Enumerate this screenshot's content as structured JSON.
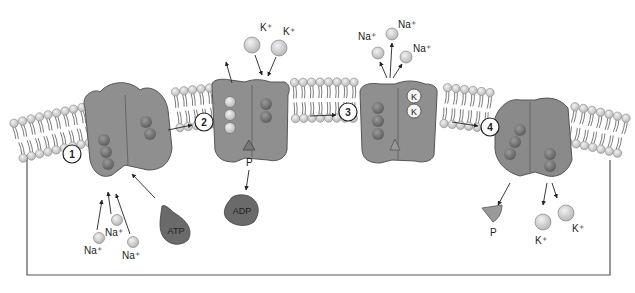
{
  "diagram": {
    "colors": {
      "protein": "#8f8f8f",
      "protein_dark": "#6f6f6f",
      "atp": "#6a6a6a",
      "ion": "#d6d6d6",
      "lipid_head": "#cfcfcf",
      "cell_outline": "#555555"
    },
    "steps": [
      {
        "number": "1"
      },
      {
        "number": "2"
      },
      {
        "number": "3"
      },
      {
        "number": "4"
      }
    ],
    "labels": {
      "k_top_1": "K⁺",
      "k_top_2": "K⁺",
      "na_top_1": "Na⁺",
      "na_top_2": "Na⁺",
      "na_top_3": "Na⁺",
      "k_bound_1": "K",
      "k_bound_2": "K",
      "phosphate_bound": "P",
      "adp": "ADP",
      "atp": "ATP",
      "na_bottom_1": "Na⁺",
      "na_bottom_2": "Na⁺",
      "na_bottom_3": "Na⁺",
      "phosphate_released": "P",
      "k_bottom_1": "K⁺",
      "k_bottom_2": "K⁺"
    }
  }
}
